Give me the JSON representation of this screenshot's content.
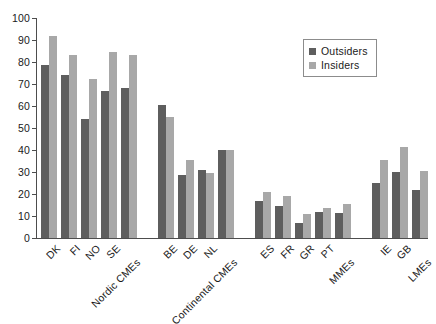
{
  "chart_data": {
    "type": "bar",
    "title": "",
    "xlabel": "",
    "ylabel": "",
    "ylim": [
      0,
      100
    ],
    "ytick_step": 10,
    "yticks": [
      0,
      10,
      20,
      30,
      40,
      50,
      60,
      70,
      80,
      90,
      100
    ],
    "grid": false,
    "legend_position": "top-right",
    "orientation": "vertical",
    "grouped": true,
    "categories": [
      "DK",
      "FI",
      "NO",
      "SE",
      "Nordic CMEs",
      "BE",
      "DE",
      "NL",
      "Continental CMEs",
      "ES",
      "FR",
      "GR",
      "PT",
      "MMEs",
      "IE",
      "GB",
      "LMEs"
    ],
    "category_is_aggregate": [
      false,
      false,
      false,
      false,
      true,
      false,
      false,
      false,
      true,
      false,
      false,
      false,
      false,
      true,
      false,
      false,
      true
    ],
    "cluster_breaks_after": [
      "Nordic CMEs",
      "Continental CMEs",
      "MMEs"
    ],
    "series": [
      {
        "name": "Outsiders",
        "color": "#5e5e5e",
        "values": [
          78.5,
          74,
          54,
          67,
          68,
          60.5,
          28.5,
          31,
          40,
          17,
          14.5,
          7,
          12,
          11.5,
          25,
          30,
          22
        ]
      },
      {
        "name": "Insiders",
        "color": "#a8a8a8",
        "values": [
          92,
          83,
          72.5,
          84.5,
          83,
          55,
          35.5,
          29.5,
          40,
          21,
          19,
          11,
          13.5,
          15.5,
          35.5,
          41.5,
          30.5
        ]
      }
    ]
  },
  "legend": {
    "items": [
      {
        "label": "Outsiders",
        "swatch": "outsiders"
      },
      {
        "label": "Insiders",
        "swatch": "insiders"
      }
    ]
  }
}
